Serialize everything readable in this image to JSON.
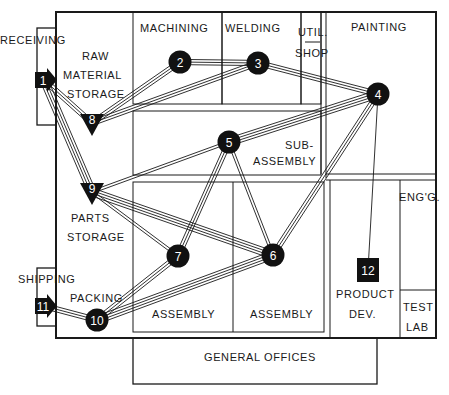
{
  "diagram": {
    "type": "facility-layout-flow",
    "areas": {
      "receiving": "RECEIVING",
      "raw_material_storage": [
        "RAW",
        "MATERIAL",
        "STORAGE"
      ],
      "machining": "MACHINING",
      "welding": "WELDING",
      "util_shop": [
        "UTIL.",
        "SHOP"
      ],
      "painting": "PAINTING",
      "sub_assembly": [
        "SUB-",
        "ASSEMBLY"
      ],
      "parts_storage": [
        "PARTS",
        "STORAGE"
      ],
      "engg": "ENG'G.",
      "shipping": "SHIPPING",
      "packing": "PACKING",
      "assembly_left": "ASSEMBLY",
      "assembly_right": "ASSEMBLY",
      "product_dev": [
        "PRODUCT",
        "DEV."
      ],
      "test_lab": [
        "TEST",
        "LAB"
      ],
      "general_offices": "GENERAL OFFICES"
    },
    "nodes": [
      {
        "id": "1",
        "label": "1",
        "shape": "arrow-square",
        "x": 44,
        "y": 80
      },
      {
        "id": "2",
        "label": "2",
        "shape": "circle",
        "x": 180,
        "y": 62
      },
      {
        "id": "3",
        "label": "3",
        "shape": "circle",
        "x": 258,
        "y": 63
      },
      {
        "id": "4",
        "label": "4",
        "shape": "circle",
        "x": 378,
        "y": 94
      },
      {
        "id": "5",
        "label": "5",
        "shape": "circle",
        "x": 229,
        "y": 142
      },
      {
        "id": "6",
        "label": "6",
        "shape": "circle",
        "x": 273,
        "y": 255
      },
      {
        "id": "7",
        "label": "7",
        "shape": "circle",
        "x": 178,
        "y": 256
      },
      {
        "id": "8",
        "label": "8",
        "shape": "triangle",
        "x": 92,
        "y": 123
      },
      {
        "id": "9",
        "label": "9",
        "shape": "triangle",
        "x": 92,
        "y": 192
      },
      {
        "id": "10",
        "label": "10",
        "shape": "circle",
        "x": 97,
        "y": 320
      },
      {
        "id": "11",
        "label": "11",
        "shape": "arrow-square",
        "x": 44,
        "y": 306
      },
      {
        "id": "12",
        "label": "12",
        "shape": "square",
        "x": 368,
        "y": 270
      }
    ],
    "flows": [
      {
        "from": "1",
        "to": "8",
        "lines": 3
      },
      {
        "from": "1",
        "to": "9",
        "lines": 4
      },
      {
        "from": "8",
        "to": "2",
        "lines": 3
      },
      {
        "from": "8",
        "to": "3",
        "lines": 3
      },
      {
        "from": "2",
        "to": "3",
        "lines": 3
      },
      {
        "from": "3",
        "to": "4",
        "lines": 3
      },
      {
        "from": "4",
        "to": "5",
        "lines": 4
      },
      {
        "from": "9",
        "to": "5",
        "lines": 2
      },
      {
        "from": "4",
        "to": "6",
        "lines": 3
      },
      {
        "from": "4",
        "to": "12",
        "lines": 1
      },
      {
        "from": "5",
        "to": "7",
        "lines": 3
      },
      {
        "from": "5",
        "to": "6",
        "lines": 2
      },
      {
        "from": "9",
        "to": "6",
        "lines": 4
      },
      {
        "from": "9",
        "to": "7",
        "lines": 2
      },
      {
        "from": "7",
        "to": "10",
        "lines": 3
      },
      {
        "from": "6",
        "to": "10",
        "lines": 4
      },
      {
        "from": "11",
        "to": "10",
        "lines": 3
      }
    ]
  }
}
